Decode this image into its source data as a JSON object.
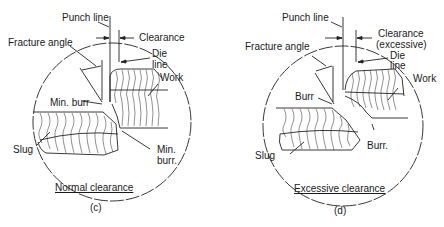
{
  "panels": [
    {
      "id": "c",
      "caption": "Normal clearance",
      "sublabel": "(c)",
      "labels": {
        "punch_line": "Punch line",
        "clearance": "Clearance",
        "fracture_angle": "Fracture angle",
        "die": "Die",
        "line": "line",
        "work": "Work",
        "min_burr_top": "Min. burr",
        "slug": "Slug",
        "min": "Min.",
        "burr": "burr."
      }
    },
    {
      "id": "d",
      "caption": "Excessive clearance",
      "sublabel": "(d)",
      "labels": {
        "punch_line": "Punch line",
        "clearance": "Clearance",
        "clearance_note": "(excessive)",
        "fracture_angle": "Fracture angle",
        "die": "Die",
        "line": "line",
        "work": "Work",
        "burr_top": "Burr",
        "slug": "Slug",
        "burr_bottom": "Burr."
      }
    }
  ]
}
